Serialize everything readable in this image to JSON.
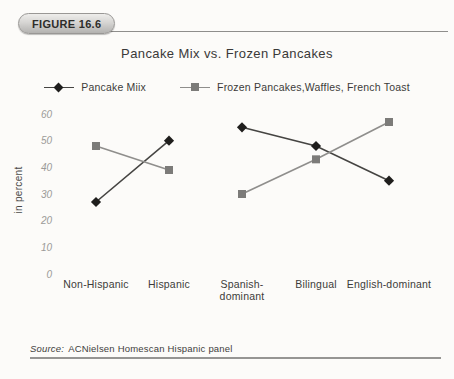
{
  "figure_label": "FIGURE 16.6",
  "title": "Pancake Mix vs. Frozen Pancakes",
  "source": {
    "prefix": "Source:",
    "text": "ACNielsen Homescan Hispanic panel"
  },
  "chart_data": {
    "type": "line",
    "title": "Pancake Mix vs. Frozen Pancakes",
    "xlabel": "",
    "ylabel": "in percent",
    "ylim": [
      0,
      60
    ],
    "yticks": [
      60,
      50,
      40,
      30,
      20,
      10,
      0
    ],
    "grid": false,
    "axes_drawn": false,
    "legend_position": "top",
    "categories": [
      "Non-Hispanic",
      "Hispanic",
      "Spanish-\ndominant",
      "Bilingual",
      "English-dominant"
    ],
    "segments": [
      [
        0,
        1
      ],
      [
        2,
        3,
        4
      ]
    ],
    "series": [
      {
        "name": "Pancake Miix",
        "marker": "diamond",
        "marker_color": "#1f1e1d",
        "line_color": "#454442",
        "values": [
          27,
          50,
          55,
          48,
          35
        ]
      },
      {
        "name": "Frozen Pancakes,Waffles, French Toast",
        "marker": "square",
        "marker_color": "#7c7b79",
        "line_color": "#8f8e8c",
        "values": [
          48,
          39,
          30,
          43,
          57
        ]
      }
    ]
  }
}
